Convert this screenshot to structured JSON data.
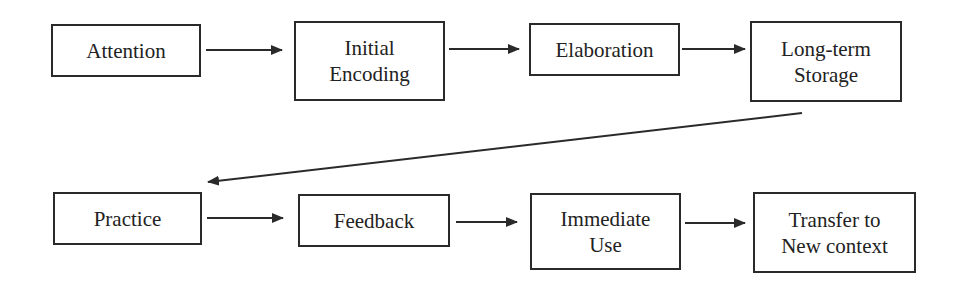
{
  "diagram": {
    "nodes": [
      {
        "id": "attention",
        "lines": [
          "Attention"
        ]
      },
      {
        "id": "initial-encoding",
        "lines": [
          "Initial",
          "Encoding"
        ]
      },
      {
        "id": "elaboration",
        "lines": [
          "Elaboration"
        ]
      },
      {
        "id": "long-term-storage",
        "lines": [
          "Long-term",
          "Storage"
        ]
      },
      {
        "id": "practice",
        "lines": [
          "Practice"
        ]
      },
      {
        "id": "feedback",
        "lines": [
          "Feedback"
        ]
      },
      {
        "id": "immediate-use",
        "lines": [
          "Immediate",
          "Use"
        ]
      },
      {
        "id": "transfer",
        "lines": [
          "Transfer to",
          "New context"
        ]
      }
    ],
    "edges": [
      {
        "from": "attention",
        "to": "initial-encoding"
      },
      {
        "from": "initial-encoding",
        "to": "elaboration"
      },
      {
        "from": "elaboration",
        "to": "long-term-storage"
      },
      {
        "from": "long-term-storage",
        "to": "practice"
      },
      {
        "from": "practice",
        "to": "feedback"
      },
      {
        "from": "feedback",
        "to": "immediate-use"
      },
      {
        "from": "immediate-use",
        "to": "transfer"
      }
    ],
    "colors": {
      "stroke": "#2a2a2a",
      "text": "#222222",
      "background": "#ffffff"
    }
  }
}
